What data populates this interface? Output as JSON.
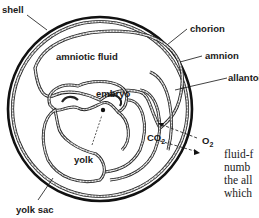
{
  "diagram": {
    "labels": {
      "shell": "shell",
      "chorion": "chorion",
      "amnion": "amnion",
      "allantois": "allantois",
      "amniotic_fluid": "amniotic fluid",
      "embryo": "embryo",
      "yolk": "yolk",
      "yolk_sac": "yolk sac",
      "co2": "CO",
      "co2_sub": "2",
      "o2": "O",
      "o2_sub": "2"
    }
  },
  "body_text": {
    "lines": [
      "fluid-f",
      "numb",
      "the all",
      "which"
    ]
  },
  "colors": {
    "line": "#111111",
    "membrane_fill": "#bdbdbd",
    "background": "#ffffff"
  }
}
